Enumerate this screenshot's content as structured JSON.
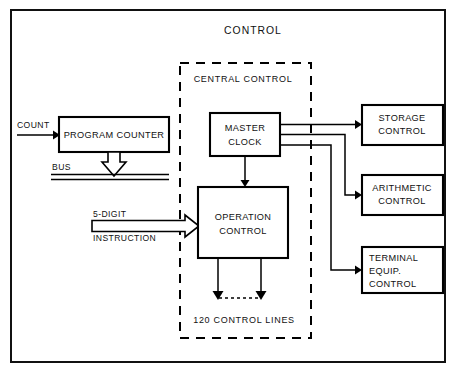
{
  "diagram": {
    "title": "CONTROL",
    "section": {
      "label": "CENTRAL CONTROL",
      "footer_label": "120 CONTROL LINES"
    },
    "boxes": [
      {
        "id": "program-counter",
        "label": "PROGRAM COUNTER",
        "lines": [
          "PROGRAM COUNTER"
        ]
      },
      {
        "id": "master-clock",
        "label": "MASTER CLOCK",
        "lines": [
          "MASTER",
          "CLOCK"
        ]
      },
      {
        "id": "operation-control",
        "label": "OPERATION CONTROL",
        "lines": [
          "OPERATION",
          "CONTROL"
        ]
      },
      {
        "id": "storage-control",
        "label": "STORAGE CONTROL",
        "lines": [
          "STORAGE",
          "CONTROL"
        ]
      },
      {
        "id": "arithmetic-control",
        "label": "ARITHMETIC CONTROL",
        "lines": [
          "ARITHMETIC",
          "CONTROL"
        ]
      },
      {
        "id": "terminal-equip-control",
        "label": "TERMINAL EQUIP. CONTROL",
        "lines": [
          "TERMINAL",
          "EQUIP.",
          "CONTROL"
        ]
      }
    ],
    "signals": [
      {
        "id": "count",
        "label": "COUNT"
      },
      {
        "id": "bus",
        "label": "BUS"
      },
      {
        "id": "instruction",
        "label": "5-DIGIT INSTRUCTION",
        "lines": [
          "5-DIGIT",
          "INSTRUCTION"
        ]
      }
    ],
    "colors": {
      "ink": "#000000",
      "paper": "#ffffff",
      "frame": "#111111"
    }
  }
}
